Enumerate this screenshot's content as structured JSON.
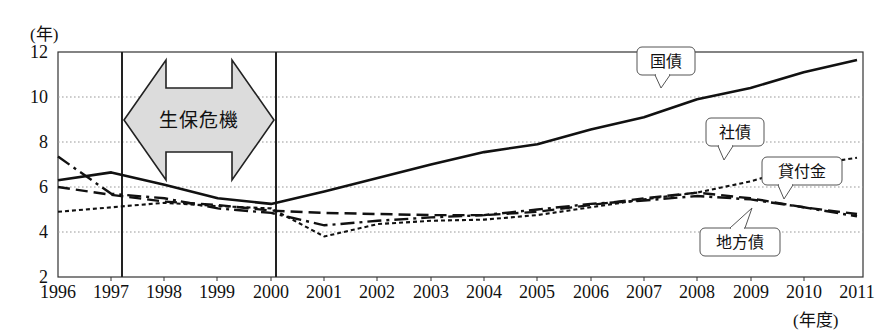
{
  "chart_data": {
    "type": "line",
    "title": "",
    "xlabel": "(年度)",
    "ylabel": "(年)",
    "ylim": [
      2,
      12
    ],
    "yticks": [
      2,
      4,
      6,
      8,
      10,
      12
    ],
    "grid": true,
    "legend_position": "inline-callouts",
    "categories": [
      "1996",
      "1997",
      "1998",
      "1999",
      "2000",
      "2001",
      "2002",
      "2003",
      "2004",
      "2005",
      "2006",
      "2007",
      "2008",
      "2009",
      "2010",
      "2011"
    ],
    "series": [
      {
        "name": "国債",
        "style": "solid",
        "values": [
          6.3,
          6.65,
          6.1,
          5.5,
          5.25,
          5.8,
          6.4,
          7.0,
          7.55,
          7.9,
          8.55,
          9.1,
          9.9,
          10.4,
          11.1,
          11.65
        ]
      },
      {
        "name": "社債",
        "style": "dotted",
        "values": [
          4.9,
          5.1,
          5.3,
          5.15,
          5.05,
          3.8,
          4.35,
          4.5,
          4.55,
          4.75,
          5.1,
          5.45,
          5.75,
          6.25,
          6.95,
          7.3
        ]
      },
      {
        "name": "貸付金",
        "style": "dashed",
        "values": [
          6.0,
          5.65,
          5.35,
          5.2,
          4.95,
          4.85,
          4.8,
          4.75,
          4.75,
          4.9,
          5.2,
          5.5,
          5.75,
          5.5,
          5.1,
          4.8
        ]
      },
      {
        "name": "地方債",
        "style": "dash-dot",
        "values": [
          7.35,
          5.7,
          5.5,
          5.05,
          4.85,
          4.3,
          4.5,
          4.65,
          4.75,
          5.0,
          5.25,
          5.4,
          5.6,
          5.45,
          5.1,
          4.7
        ]
      }
    ],
    "annotations": [
      {
        "name": "生保危機",
        "type": "double-arrow-band",
        "from": "1997",
        "to": "2000"
      },
      {
        "name": "国債",
        "type": "callout"
      },
      {
        "name": "社債",
        "type": "callout"
      },
      {
        "name": "貸付金",
        "type": "callout"
      },
      {
        "name": "地方債",
        "type": "callout"
      }
    ],
    "colors": {
      "line": "#111111",
      "grid": "#999999",
      "axis": "#222222",
      "band_fill": "#d9d9d9"
    }
  },
  "axes": {
    "y_unit": "(年)",
    "x_unit": "(年度)",
    "y_ticks": [
      "12",
      "10",
      "8",
      "6",
      "4",
      "2"
    ],
    "x_ticks": [
      "1996",
      "1997",
      "1998",
      "1999",
      "2000",
      "2001",
      "2002",
      "2003",
      "2004",
      "2005",
      "2006",
      "2007",
      "2008",
      "2009",
      "2010",
      "2011"
    ]
  },
  "callouts": {
    "kokusai": "国債",
    "shasai": "社債",
    "kashitsukekin": "貸付金",
    "chihousai": "地方債"
  },
  "band": {
    "label": "生保危機"
  }
}
